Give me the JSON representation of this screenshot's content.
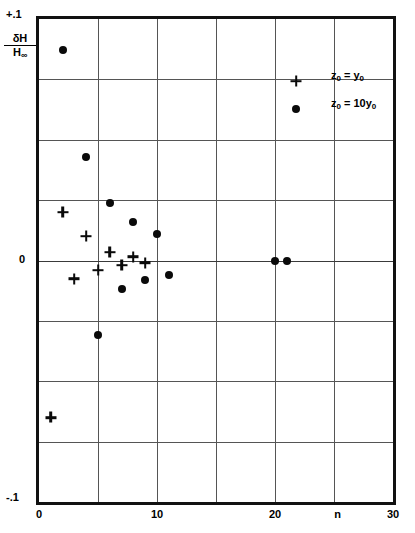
{
  "chart_data": {
    "type": "scatter",
    "title": "",
    "xlabel": "n",
    "ylabel": "δH/H∞",
    "xlim": [
      0,
      30
    ],
    "ylim": [
      -0.1,
      0.1
    ],
    "grid": true,
    "x_ticks": [
      "0",
      "10",
      "20",
      "30"
    ],
    "x_tick_values": [
      0,
      10,
      20,
      30
    ],
    "x_gridlines": [
      5,
      10,
      15,
      20,
      25
    ],
    "y_ticks": [
      "+.1",
      "0",
      "-.1"
    ],
    "y_tick_values": [
      0.1,
      0,
      -0.1
    ],
    "y_gridlines": [
      0.075,
      0.05,
      0.025,
      0,
      -0.025,
      -0.05,
      -0.075
    ],
    "legend_position": "top-right",
    "series": [
      {
        "name": "z_0 = y_0",
        "marker": "plus",
        "color": "#0a0a0a",
        "points": [
          {
            "x": 1,
            "y": -0.065
          },
          {
            "x": 2,
            "y": 0.02
          },
          {
            "x": 3,
            "y": -0.0075
          },
          {
            "x": 4,
            "y": 0.01
          },
          {
            "x": 5,
            "y": -0.004
          },
          {
            "x": 6,
            "y": 0.0035
          },
          {
            "x": 7,
            "y": -0.002
          },
          {
            "x": 8,
            "y": 0.0015
          },
          {
            "x": 9,
            "y": -0.001
          }
        ]
      },
      {
        "name": "z_0 = 10y_0",
        "marker": "circle",
        "color": "#0a0a0a",
        "points": [
          {
            "x": 2,
            "y": 0.087
          },
          {
            "x": 4,
            "y": 0.043
          },
          {
            "x": 5,
            "y": -0.031
          },
          {
            "x": 6,
            "y": 0.024
          },
          {
            "x": 7,
            "y": -0.012
          },
          {
            "x": 8,
            "y": 0.016
          },
          {
            "x": 9,
            "y": -0.008
          },
          {
            "x": 10,
            "y": 0.011
          },
          {
            "x": 11,
            "y": -0.006
          },
          {
            "x": 20,
            "y": 0.0
          },
          {
            "x": 21,
            "y": 0.0
          }
        ]
      }
    ]
  },
  "axes": {
    "y_max_label": "+.1",
    "y_zero_label": "0",
    "y_min_label": "-.1",
    "y_title_numerator": "δH",
    "y_title_denominator": "H",
    "y_title_denominator_sub": "∞",
    "x_axis_name": "n",
    "x_tick_labels": [
      "0",
      "10",
      "20",
      "30"
    ]
  },
  "legend": {
    "entries": [
      {
        "marker": "plus",
        "var": "z",
        "var_sub": "0",
        "equals": " = ",
        "value": "y",
        "value_sub": "0",
        "coefficient": ""
      },
      {
        "marker": "circle",
        "var": "z",
        "var_sub": "0",
        "equals": " = ",
        "value": "y",
        "value_sub": "0",
        "coefficient": "10"
      }
    ]
  },
  "caption": {
    "text": ""
  }
}
